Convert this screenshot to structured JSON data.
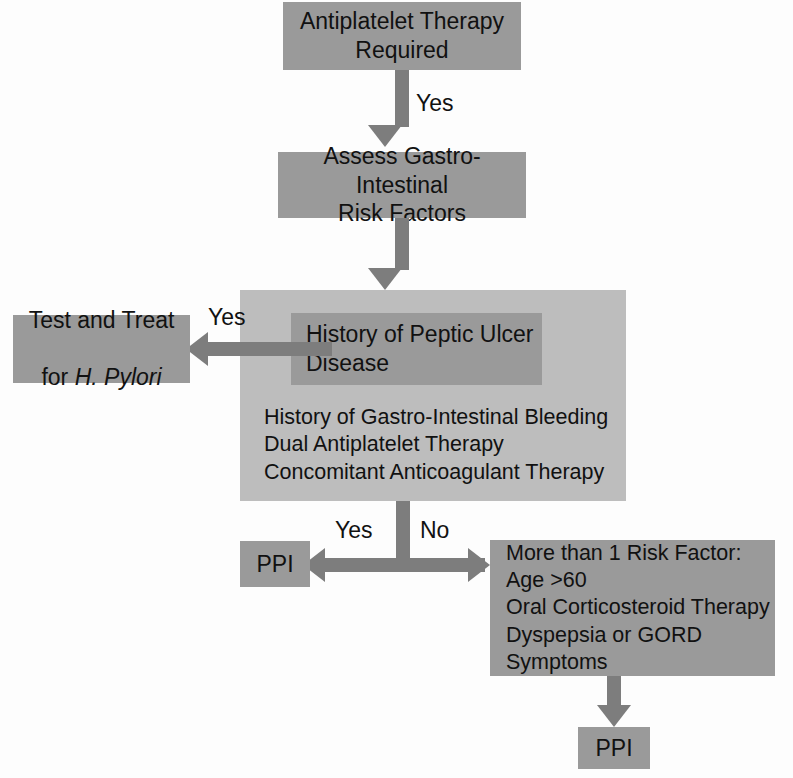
{
  "diagram": {
    "colors": {
      "node_dark": "#9a9a9a",
      "node_light": "#bdbdbd",
      "arrow": "#7d7d7d",
      "text": "#111111",
      "background": "#fdfdfd"
    },
    "nodes": {
      "antiplatelet_required": "Antiplatelet Therapy\nRequired",
      "assess_gi_risk": "Assess Gastro-Intestinal\nRisk Factors",
      "peptic_ulcer": "History of Peptic Ulcer\nDisease",
      "test_and_treat_line1": "Test and Treat",
      "test_and_treat_line2_prefix": "for ",
      "test_and_treat_line2_italic": "H. Pylori",
      "risk_list": "History of Gastro-Intestinal Bleeding\nDual Antiplatelet Therapy\nConcomitant Anticoagulant Therapy",
      "ppi_left": "PPI",
      "more_risk_factors": "More than 1 Risk Factor:\nAge >60\nOral Corticosteroid Therapy\nDyspepsia or GORD\nSymptoms",
      "ppi_bottom": "PPI"
    },
    "edge_labels": {
      "yes_top": "Yes",
      "yes_pylori": "Yes",
      "yes_ppi": "Yes",
      "no_risk": "No"
    }
  }
}
